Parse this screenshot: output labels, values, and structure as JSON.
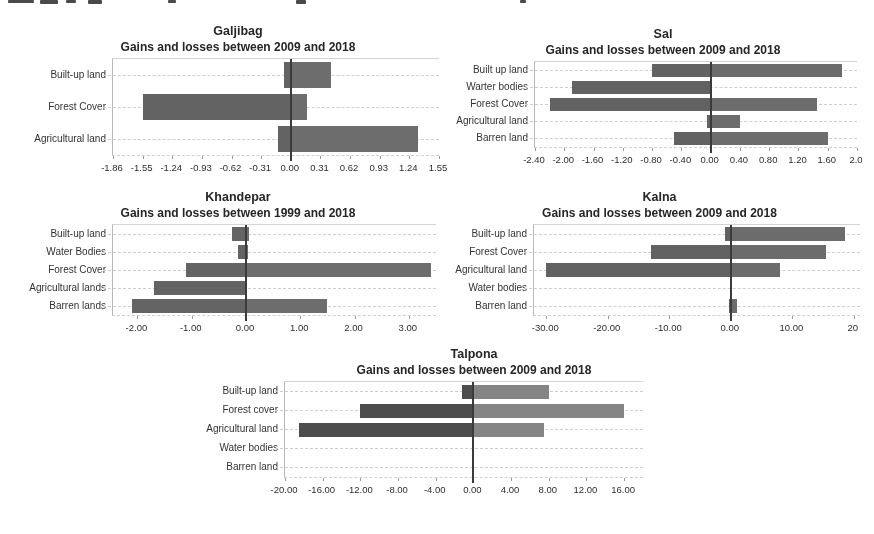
{
  "figure": {
    "background": "#ffffff",
    "text_color": "#262626",
    "gridline_color": "#cfcfcf",
    "zero_line_color": "#3b3b3b",
    "note": "Panel of five horizontal gain/loss bar charts; unreadable cropped text remnant along top edge"
  },
  "chart_data": [
    {
      "type": "bar",
      "orientation": "horizontal",
      "title": "Galjibag",
      "subtitle": "Gains and losses between 2009 and 2018",
      "categories": [
        "Built-up land",
        "Forest Cover",
        "Agricultural land"
      ],
      "series": [
        {
          "name": "loss",
          "values": [
            -0.07,
            -1.55,
            -0.13
          ]
        },
        {
          "name": "gain",
          "values": [
            0.42,
            0.17,
            1.33
          ]
        }
      ],
      "xlim": [
        -1.86,
        1.55
      ],
      "xtick_values": [
        -1.86,
        -1.55,
        -1.24,
        -0.93,
        -0.62,
        -0.31,
        0,
        0.31,
        0.62,
        0.93,
        1.24,
        1.55
      ],
      "xtick_labels": [
        "-1.86",
        "-1.55",
        "-1.24",
        "-0.93",
        "-0.62",
        "-0.31",
        "0.00",
        "0.31",
        "0.62",
        "0.93",
        "1.24",
        "1.55"
      ],
      "loss_color": "#636363",
      "gain_color": "#6d6d6d",
      "grid": "dashed horizontal category lines",
      "legend": "none"
    },
    {
      "type": "bar",
      "orientation": "horizontal",
      "title": "Sal",
      "subtitle": "Gains and losses between 2009 and 2018",
      "categories": [
        "Built up land",
        "Warter bodies",
        "Forest Cover",
        "Agricultural land",
        "Barren land"
      ],
      "series": [
        {
          "name": "loss",
          "values": [
            -0.8,
            -1.9,
            -2.2,
            -0.05,
            -0.5
          ]
        },
        {
          "name": "gain",
          "values": [
            1.8,
            0.0,
            1.45,
            0.4,
            1.6
          ]
        }
      ],
      "xlim": [
        -2.4,
        2.0
      ],
      "xtick_values": [
        -2.4,
        -2.0,
        -1.6,
        -1.2,
        -0.8,
        -0.4,
        0,
        0.4,
        0.8,
        1.2,
        1.6,
        2.0
      ],
      "xtick_labels": [
        "-2.40",
        "-2.00",
        "-1.60",
        "-1.20",
        "-0.80",
        "-0.40",
        "0.00",
        "0.40",
        "0.80",
        "1.20",
        "1.60",
        "2.0"
      ],
      "loss_color": "#626262",
      "gain_color": "#6c6c6c",
      "grid": "dashed horizontal category lines",
      "legend": "none"
    },
    {
      "type": "bar",
      "orientation": "horizontal",
      "title": "Khandepar",
      "subtitle": "Gains and losses between 1999 and 2018",
      "categories": [
        "Built-up land",
        "Water Bodies",
        "Forest Cover",
        "Agricultural lands",
        "Barren lands"
      ],
      "series": [
        {
          "name": "loss",
          "values": [
            -0.25,
            -0.15,
            -1.1,
            -1.7,
            -2.1
          ]
        },
        {
          "name": "gain",
          "values": [
            0.05,
            0.03,
            3.4,
            0.0,
            1.5
          ]
        }
      ],
      "xlim": [
        -2.45,
        3.5
      ],
      "xtick_values": [
        -2,
        -1,
        0,
        1,
        2,
        3
      ],
      "xtick_labels": [
        "-2.00",
        "-1.00",
        "0.00",
        "1.00",
        "2.00",
        "3.00"
      ],
      "loss_color": "#646464",
      "gain_color": "#6d6d6d",
      "grid": "dashed horizontal category lines",
      "legend": "none"
    },
    {
      "type": "bar",
      "orientation": "horizontal",
      "title": "Kalna",
      "subtitle": "Gains and losses between 2009 and 2018",
      "categories": [
        "Built-up land",
        "Forest Cover",
        "Agricultural land",
        "Water bodies",
        "Barren land"
      ],
      "series": [
        {
          "name": "loss",
          "values": [
            -1.0,
            -13.0,
            -30.0,
            0,
            -0.3
          ]
        },
        {
          "name": "gain",
          "values": [
            18.5,
            15.5,
            8.0,
            0,
            1.0
          ]
        }
      ],
      "xlim": [
        -32,
        21
      ],
      "xtick_values": [
        -30,
        -20,
        -10,
        0,
        10,
        20
      ],
      "xtick_labels": [
        "-30.00",
        "-20.00",
        "-10.00",
        "0.00",
        "10.00",
        "20"
      ],
      "loss_color": "#626262",
      "gain_color": "#6c6c6c",
      "grid": "dashed horizontal category lines",
      "legend": "none"
    },
    {
      "type": "bar",
      "orientation": "horizontal",
      "title": "Talpona",
      "subtitle": "Gains and losses between 2009 and 2018",
      "categories": [
        "Built-up land",
        "Forest cover",
        "Agricultural land",
        "Water bodies",
        "Barren land"
      ],
      "series": [
        {
          "name": "loss",
          "values": [
            -1.2,
            -12.0,
            -18.5,
            0,
            0
          ]
        },
        {
          "name": "gain",
          "values": [
            8.0,
            16.0,
            7.5,
            0,
            0
          ]
        }
      ],
      "xlim": [
        -20,
        18
      ],
      "xtick_values": [
        -20,
        -16,
        -12,
        -8,
        -4,
        0,
        4,
        8,
        12,
        16
      ],
      "xtick_labels": [
        "-20.00",
        "-16.00",
        "-12.00",
        "-8.00",
        "-4.00",
        "0.00",
        "4.00",
        "8.00",
        "12.00",
        "16.00"
      ],
      "loss_color": "#4d4d4d",
      "gain_color": "#858585",
      "grid": "dashed horizontal category lines",
      "legend": "none"
    }
  ]
}
